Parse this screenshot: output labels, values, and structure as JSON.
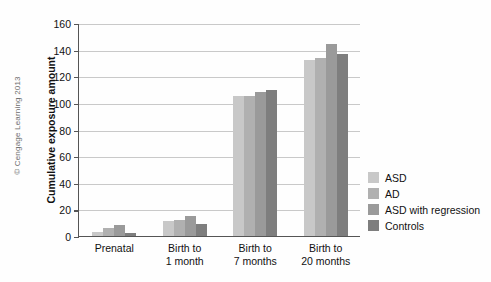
{
  "credit": "© Cengage Learning 2013",
  "chart_data": {
    "type": "bar",
    "title": "",
    "xlabel": "",
    "ylabel": "Cumulative exposure amount",
    "ylim": [
      0,
      160
    ],
    "yticks": [
      0,
      20,
      40,
      60,
      80,
      100,
      120,
      140,
      160
    ],
    "ytick_labels": [
      "0",
      "20",
      "40",
      "60",
      "80",
      "100",
      "120",
      "140",
      "160"
    ],
    "grid": true,
    "legend_position": "right",
    "categories": [
      "Prenatal",
      "Birth to 1 month",
      "Birth to 7 months",
      "Birth to 20 months"
    ],
    "category_lines": [
      [
        "Prenatal"
      ],
      [
        "Birth to",
        "1 month"
      ],
      [
        "Birth to",
        "7 months"
      ],
      [
        "Birth to",
        "20 months"
      ]
    ],
    "series": [
      {
        "name": "ASD",
        "color": "#c8c8c8",
        "values": [
          3,
          11,
          105,
          132
        ]
      },
      {
        "name": "AD",
        "color": "#b0b0b0",
        "values": [
          6,
          12,
          105,
          134
        ]
      },
      {
        "name": "ASD with regression",
        "color": "#9a9a9a",
        "values": [
          8,
          15,
          108,
          144
        ]
      },
      {
        "name": "Controls",
        "color": "#7e7e7e",
        "values": [
          2,
          9,
          110,
          137
        ]
      }
    ]
  }
}
